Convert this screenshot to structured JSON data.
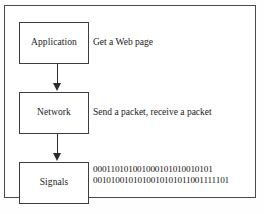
{
  "figure": {
    "background_color": "#ffffff",
    "border_color": "#4a4a4a",
    "text_color": "#1a1a1a"
  },
  "layers": [
    {
      "id": "application",
      "label": "Application",
      "description": "Get a Web page"
    },
    {
      "id": "network",
      "label": "Network",
      "description": "Send a packet, receive a packet"
    },
    {
      "id": "signals",
      "label": "Signals",
      "description_lines": [
        "000110101001000101010010101",
        "0010100101010010101011001111101"
      ]
    }
  ],
  "connectors": [
    {
      "id": "application-to-network",
      "from": "application",
      "to": "network",
      "direction": "down"
    },
    {
      "id": "network-to-signals",
      "from": "network",
      "to": "signals",
      "direction": "down"
    }
  ]
}
